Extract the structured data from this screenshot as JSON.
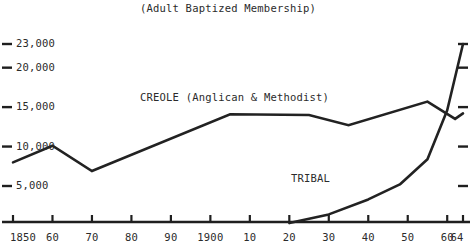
{
  "chart_data": {
    "type": "line",
    "title": "(Adult Baptized Membership)",
    "xlabel": "",
    "ylabel": "",
    "grid": false,
    "legend_position": "inline-annotations",
    "xlim": [
      1850,
      1964
    ],
    "ylim": [
      0,
      24000
    ],
    "x_tick_labels": [
      "1850",
      "60",
      "70",
      "80",
      "90",
      "1900",
      "10",
      "20",
      "30",
      "40",
      "50",
      "60",
      "64"
    ],
    "x_tick_values": [
      1850,
      1860,
      1870,
      1880,
      1890,
      1900,
      1910,
      1920,
      1930,
      1940,
      1950,
      1960,
      1964
    ],
    "y_tick_labels": [
      "5,000",
      "10,000",
      "15,000",
      "20,000",
      "23,000"
    ],
    "y_tick_values": [
      5000,
      10000,
      15000,
      20000,
      23000
    ],
    "series": [
      {
        "name": "CREOLE (Anglican & Methodist)",
        "color": "#222222",
        "x": [
          1850,
          1860,
          1870,
          1905,
          1925,
          1935,
          1955,
          1962,
          1964
        ],
        "values": [
          8000,
          10100,
          6900,
          14100,
          14000,
          12700,
          15700,
          13500,
          14200
        ]
      },
      {
        "name": "TRIBAL",
        "color": "#222222",
        "x": [
          1920,
          1930,
          1940,
          1948,
          1955,
          1960,
          1964
        ],
        "values": [
          300,
          1400,
          3300,
          5200,
          8400,
          14600,
          23000
        ]
      }
    ],
    "annotations": [
      {
        "text": "CREOLE (Anglican & Methodist)",
        "series": "CREOLE (Anglican & Methodist)"
      },
      {
        "text": "TRIBAL",
        "series": "TRIBAL"
      }
    ]
  }
}
